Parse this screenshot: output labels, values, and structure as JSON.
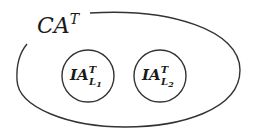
{
  "diagram": {
    "outer_set": {
      "base": "CA",
      "superscript": "T"
    },
    "inner_sets": [
      {
        "base": "IA",
        "superscript": "T",
        "subscript_base": "L",
        "subscript_index": "1"
      },
      {
        "base": "IA",
        "superscript": "T",
        "subscript_base": "L",
        "subscript_index": "2"
      }
    ],
    "colors": {
      "stroke": "#333333",
      "text": "#1a1a1a"
    }
  }
}
